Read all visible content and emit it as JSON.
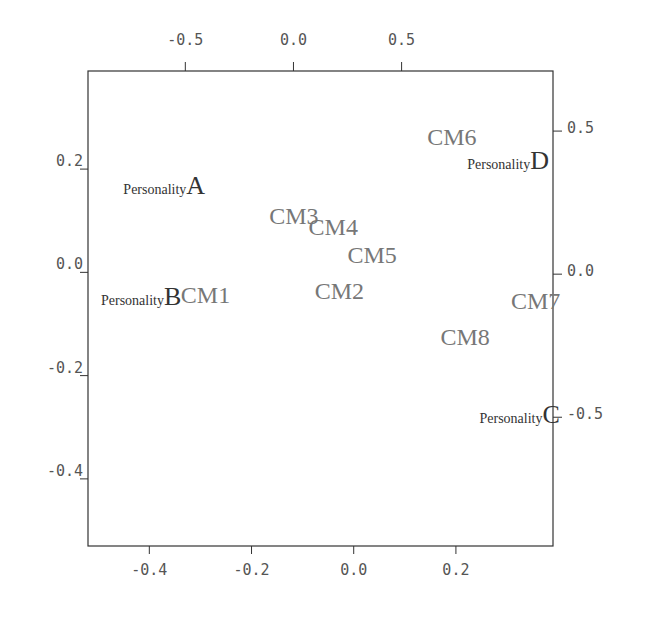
{
  "chart_data": {
    "type": "scatter",
    "subtype": "biplot",
    "title": "",
    "xlabel": "",
    "ylabel": "",
    "grid": false,
    "primary_axes": {
      "x_ticks": [
        -0.4,
        -0.2,
        0.0,
        0.2
      ],
      "x_tick_labels": [
        "-0.4",
        "-0.2",
        "0.0",
        "0.2"
      ],
      "y_ticks": [
        0.2,
        0.0,
        -0.2,
        -0.4
      ],
      "y_tick_labels": [
        "0.2",
        "0.0",
        "-0.2",
        "-0.4"
      ],
      "xlim": [
        -0.52,
        0.39
      ],
      "ylim": [
        -0.53,
        0.39
      ]
    },
    "secondary_axes": {
      "x_ticks": [
        -0.5,
        0.0,
        0.5
      ],
      "x_tick_labels": [
        "-0.5",
        "0.0",
        "0.5"
      ],
      "y_ticks": [
        0.5,
        0.0,
        -0.5
      ],
      "y_tick_labels": [
        "0.5",
        "0.0",
        "-0.5"
      ],
      "xlim": [
        -0.95,
        1.2
      ],
      "ylim": [
        -0.95,
        0.71
      ]
    },
    "points": [
      {
        "label": "CM1",
        "x": -0.29,
        "y": -0.043
      },
      {
        "label": "CM2",
        "x": -0.028,
        "y": -0.037
      },
      {
        "label": "CM3",
        "x": -0.117,
        "y": 0.109
      },
      {
        "label": "CM4",
        "x": -0.04,
        "y": 0.087
      },
      {
        "label": "CM5",
        "x": 0.036,
        "y": 0.033
      },
      {
        "label": "CM6",
        "x": 0.192,
        "y": 0.262
      },
      {
        "label": "CM7",
        "x": 0.356,
        "y": -0.056
      },
      {
        "label": "CM8",
        "x": 0.218,
        "y": -0.126
      }
    ],
    "vectors": [
      {
        "prefix": "Personality",
        "letter": "A",
        "x": -0.45,
        "y": 0.31
      },
      {
        "prefix": "Personality",
        "letter": "B",
        "x": -0.56,
        "y": -0.077
      },
      {
        "prefix": "Personality",
        "letter": "C",
        "x": 1.19,
        "y": -0.49
      },
      {
        "prefix": "Personality",
        "letter": "D",
        "x": 1.14,
        "y": 0.4
      }
    ]
  }
}
